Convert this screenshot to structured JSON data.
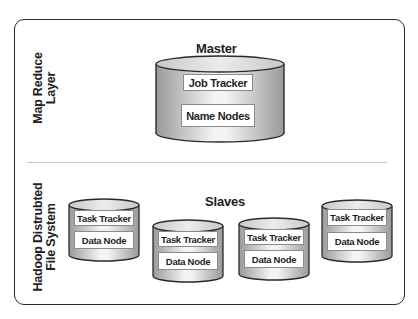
{
  "diagram": {
    "layers": {
      "top": {
        "label_line1": "Map Reduce",
        "label_line2": "Layer"
      },
      "bottom": {
        "label_line1": "Hadoop Distrubted",
        "label_line2": "File System"
      }
    },
    "master": {
      "heading": "Master",
      "components": [
        "Job Tracker",
        "Name Nodes"
      ]
    },
    "slaves": {
      "heading": "Slaves",
      "nodes": [
        {
          "task": "Task Tracker",
          "data": "Data Node"
        },
        {
          "task": "Task Tracker",
          "data": "Data Node"
        },
        {
          "task": "Task Tracker",
          "data": "Data Node"
        },
        {
          "task": "Task Tracker",
          "data": "Data Node"
        }
      ]
    },
    "colors": {
      "cylinder_dark": "#9a9a9a",
      "cylinder_light": "#f4f4f4",
      "outline": "#2a2a2a",
      "divider": "#c6c6c6"
    }
  }
}
